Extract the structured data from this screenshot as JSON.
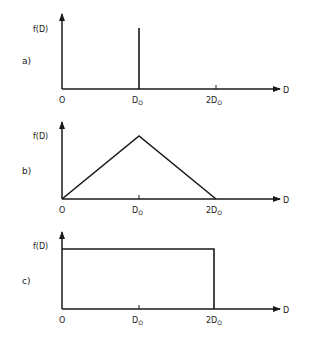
{
  "ylabel": "f(D)",
  "xlabel": "D",
  "ticks": {
    "origin": "O",
    "d0_main": "D",
    "d0_sub": "O",
    "two_d0_main": "2D",
    "two_d0_sub": "O"
  },
  "panels": [
    {
      "label": "a)",
      "shape": "delta spike at D0"
    },
    {
      "label": "b)",
      "shape": "triangle from 0 to 2D0, peak at D0"
    },
    {
      "label": "c)",
      "shape": "rectangle (uniform) from 0 to 2D0"
    }
  ],
  "colors": {
    "ink": "#1a1a1a",
    "background": "#ffffff"
  }
}
